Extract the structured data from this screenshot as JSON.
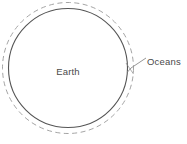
{
  "diagram": {
    "background_color": "#ffffff",
    "labels": {
      "earth": "Earth",
      "oceans": "Oceans"
    },
    "shapes": {
      "earth_circle": {
        "name": "earth-circle",
        "style": "solid",
        "stroke_color": "#555555",
        "center_x": 68,
        "center_y": 68,
        "radius": 60
      },
      "oceans_circle": {
        "name": "oceans-circle",
        "style": "dashed",
        "stroke_color": "#9a9a9a",
        "center_x": 68,
        "center_y": 68,
        "radius": 66
      }
    },
    "leader_line": {
      "name": "oceans-leader-line",
      "stroke_color": "#8a8a8a",
      "from_x": 129,
      "from_y": 70,
      "to_x": 146,
      "to_y": 58
    },
    "label_positions": {
      "earth": {
        "x": 68,
        "y": 72
      },
      "oceans": {
        "x": 148,
        "y": 62
      }
    },
    "text_color": "#4a4a4a"
  }
}
